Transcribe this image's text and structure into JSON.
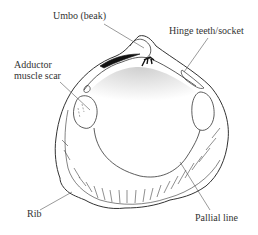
{
  "diagram": {
    "labels": [
      {
        "id": "umbo",
        "text": "Umbo (beak)"
      },
      {
        "id": "hinge",
        "text": "Hinge teeth/socket"
      },
      {
        "id": "adductor_line1",
        "text": "Adductor"
      },
      {
        "id": "adductor_line2",
        "text": "muscle scar"
      },
      {
        "id": "rib",
        "text": "Rib"
      },
      {
        "id": "pallial",
        "text": "Pallial line"
      }
    ],
    "colors": {
      "line": "#333333",
      "shading": "#d8d8d8",
      "background": "#ffffff"
    }
  }
}
